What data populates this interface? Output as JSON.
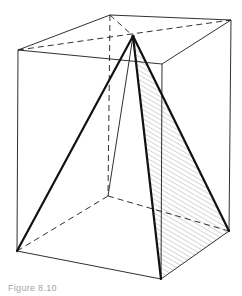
{
  "figure": {
    "colors": {
      "stroke": "#1a1a1a",
      "hatch": "#8a8a8a",
      "background": "#ffffff"
    },
    "vertices": {
      "top_back_left": [
        110,
        15
      ],
      "top_back_right": [
        231,
        20
      ],
      "top_front_left": [
        18,
        50
      ],
      "top_front_right": [
        162,
        64
      ],
      "bottom_back_left": [
        108,
        196
      ],
      "bottom_back_right": [
        229,
        231
      ],
      "bottom_front_left": [
        17,
        251
      ],
      "bottom_front_right": [
        161,
        279
      ],
      "apex": [
        133,
        36
      ]
    },
    "caption": "Figure 8.10"
  }
}
